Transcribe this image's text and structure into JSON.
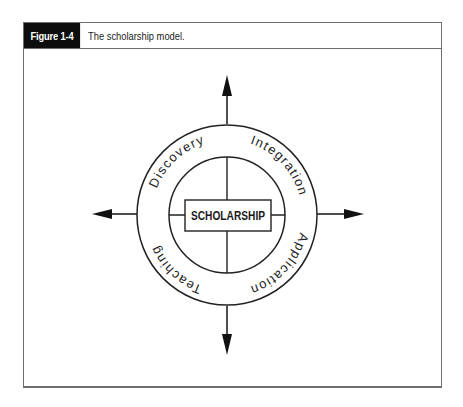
{
  "figure": {
    "label": "Figure 1-4",
    "caption": "The scholarship model."
  },
  "diagram": {
    "center_label": "SCHOLARSHIP",
    "ring_labels": {
      "top_left": "Discovery",
      "top_right": "Integration",
      "bottom_right": "Application",
      "bottom_left": "Teaching"
    },
    "arrows": [
      "up",
      "right",
      "down",
      "left"
    ],
    "colors": {
      "stroke": "#222222",
      "label_background": "#0d0d0d",
      "frame_border": "#6e6e6e"
    }
  }
}
